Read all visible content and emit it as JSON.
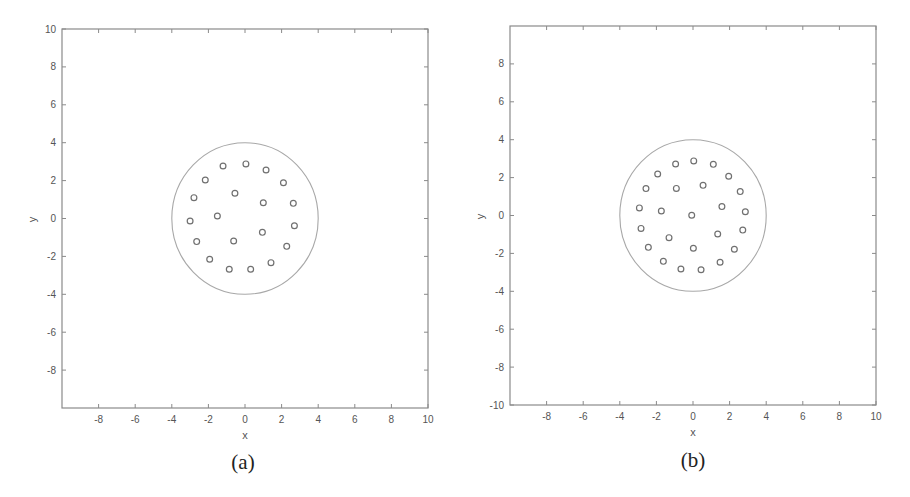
{
  "figure": {
    "panels": [
      {
        "id": "a",
        "caption": "(a)"
      },
      {
        "id": "b",
        "caption": "(b)"
      }
    ]
  },
  "style": {
    "axis_color": "#8a8a8a",
    "tick_label_color": "#555555",
    "boundary_circle_color": "#a8a8a8",
    "marker_color": "#707070",
    "background": "#ffffff"
  },
  "chart_data": [
    {
      "type": "scatter",
      "panel": "(a)",
      "title": "",
      "xlabel": "x",
      "ylabel": "y",
      "xlim": [
        -10,
        10
      ],
      "ylim": [
        -10,
        10
      ],
      "xticks": [
        "-8",
        "-6",
        "-4",
        "-2",
        "0",
        "2",
        "4",
        "6",
        "8",
        "10"
      ],
      "yticks": [
        "10",
        "8",
        "6",
        "4",
        "2",
        "0",
        "-2",
        "-4",
        "-6",
        "-8"
      ],
      "grid": false,
      "legend": null,
      "annotations": [
        {
          "type": "circle",
          "center": [
            0,
            0
          ],
          "radius": 4
        }
      ],
      "series": [
        {
          "name": "points",
          "marker": "open-circle",
          "points": [
            [
              0.05,
              2.88
            ],
            [
              1.15,
              2.56
            ],
            [
              2.1,
              1.89
            ],
            [
              2.64,
              0.8
            ],
            [
              2.7,
              -0.38
            ],
            [
              2.28,
              -1.47
            ],
            [
              1.42,
              -2.33
            ],
            [
              0.31,
              -2.68
            ],
            [
              -0.86,
              -2.68
            ],
            [
              -1.93,
              -2.15
            ],
            [
              -2.64,
              -1.22
            ],
            [
              -3.0,
              -0.13
            ],
            [
              -2.79,
              1.1
            ],
            [
              -2.17,
              2.03
            ],
            [
              -1.2,
              2.77
            ],
            [
              -0.55,
              1.33
            ],
            [
              1.0,
              0.83
            ],
            [
              -1.51,
              0.13
            ],
            [
              -0.62,
              -1.19
            ],
            [
              0.95,
              -0.73
            ]
          ]
        }
      ]
    },
    {
      "type": "scatter",
      "panel": "(b)",
      "title": "",
      "xlabel": "x",
      "ylabel": "y",
      "xlim": [
        -10,
        10
      ],
      "ylim": [
        -10,
        10
      ],
      "xticks": [
        "-8",
        "-6",
        "-4",
        "-2",
        "0",
        "2",
        "4",
        "6",
        "8",
        "10"
      ],
      "yticks": [
        "8",
        "6",
        "4",
        "2",
        "0",
        "-2",
        "-4",
        "-6",
        "-8",
        "-10"
      ],
      "grid": false,
      "legend": null,
      "annotations": [
        {
          "type": "circle",
          "center": [
            0,
            0
          ],
          "radius": 4
        }
      ],
      "series": [
        {
          "name": "points",
          "marker": "open-circle",
          "points": [
            [
              0.04,
              2.88
            ],
            [
              1.11,
              2.7
            ],
            [
              1.95,
              2.07
            ],
            [
              2.58,
              1.26
            ],
            [
              2.86,
              0.2
            ],
            [
              2.72,
              -0.77
            ],
            [
              2.26,
              -1.78
            ],
            [
              1.48,
              -2.47
            ],
            [
              0.44,
              -2.86
            ],
            [
              -0.66,
              -2.82
            ],
            [
              -1.62,
              -2.42
            ],
            [
              -2.44,
              -1.68
            ],
            [
              -2.84,
              -0.68
            ],
            [
              -2.93,
              0.4
            ],
            [
              -2.57,
              1.42
            ],
            [
              -1.93,
              2.19
            ],
            [
              -0.95,
              2.72
            ],
            [
              -0.91,
              1.43
            ],
            [
              0.55,
              1.59
            ],
            [
              1.58,
              0.47
            ],
            [
              1.35,
              -0.98
            ],
            [
              0.02,
              -1.73
            ],
            [
              -1.31,
              -1.17
            ],
            [
              -1.73,
              0.24
            ],
            [
              -0.07,
              0.01
            ]
          ]
        }
      ]
    }
  ]
}
